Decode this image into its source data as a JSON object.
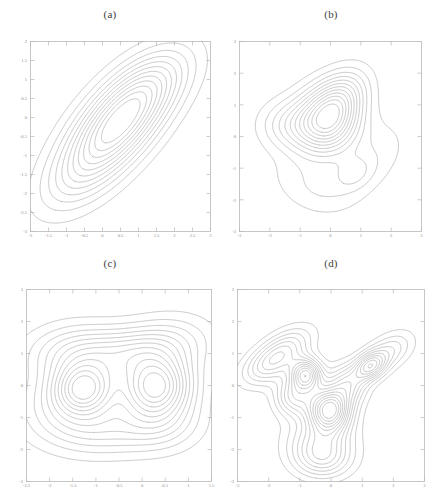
{
  "figure": {
    "background_color": "#ffffff",
    "contour_color": "#a5a5a5",
    "axis_color": "#b9b9b9",
    "label_color": "#8d8d8d"
  },
  "panels": [
    {
      "key": "a",
      "title": "(a)",
      "xlabels": [
        "-2",
        "-1.5",
        "-1",
        "-0.5",
        "0",
        "0.5",
        "1",
        "1.5",
        "2",
        "2.5",
        "3"
      ],
      "ylabels": [
        "2",
        "1.5",
        "1",
        "0.5",
        "0",
        "-0.5",
        "-1",
        "-1.5",
        "-2",
        "-2.5",
        "-3"
      ],
      "xlim": [
        -2,
        3
      ],
      "ylim": [
        -3,
        2
      ],
      "n_contours": 12,
      "modes": 1,
      "mode_centers": [
        [
          0.45,
          -0.2
        ]
      ]
    },
    {
      "key": "b",
      "title": "(b)",
      "xlabels": [
        "-3",
        "-2",
        "-1",
        "0",
        "1",
        "2",
        "3"
      ],
      "ylabels": [
        "3",
        "2",
        "1",
        "0",
        "-1",
        "-2",
        "-3"
      ],
      "xlim": [
        -3,
        3
      ],
      "ylim": [
        -3,
        3
      ],
      "n_contours": 12,
      "modes": 2,
      "mode_centers": [
        [
          -0.1,
          0.45
        ],
        [
          0.75,
          -1.15
        ]
      ]
    },
    {
      "key": "c",
      "title": "(c)",
      "xlabels": [
        "-2.5",
        "-2",
        "-1.5",
        "-1",
        "-0.5",
        "0",
        "0.5",
        "1",
        "1.5"
      ],
      "ylabels": [
        "3",
        "2",
        "1",
        "0",
        "-1",
        "-2",
        "-3"
      ],
      "xlim": [
        -2.5,
        1.5
      ],
      "ylim": [
        -3,
        3
      ],
      "n_contours": 12,
      "modes": 2,
      "mode_centers": [
        [
          -1.25,
          -0.1
        ],
        [
          0.3,
          -0.05
        ]
      ]
    },
    {
      "key": "d",
      "title": "(d)",
      "xlabels": [
        "-3",
        "-2",
        "-1",
        "0",
        "1",
        "2",
        "3"
      ],
      "ylabels": [
        "3",
        "2",
        "1",
        "0",
        "-1",
        "-2",
        "-3"
      ],
      "xlim": [
        -3,
        3
      ],
      "ylim": [
        -3,
        3
      ],
      "n_contours": 13,
      "modes": 3,
      "mode_centers": [
        [
          -0.8,
          0.35
        ],
        [
          1.25,
          0.6
        ],
        [
          -0.05,
          -0.75
        ]
      ]
    }
  ],
  "chart_data": {
    "type": "line",
    "subtype": "contour",
    "title": "",
    "panel_count": 4,
    "panels": [
      {
        "label": "(a)",
        "xlabel": "",
        "ylabel": "",
        "xlim": [
          -2,
          3
        ],
        "ylim": [
          -3,
          2
        ],
        "xticks": [
          -2,
          -1.5,
          -1,
          -0.5,
          0,
          0.5,
          1,
          1.5,
          2,
          2.5,
          3
        ],
        "yticks": [
          2,
          1.5,
          1,
          0.5,
          0,
          -0.5,
          -1,
          -1.5,
          -2,
          -2.5,
          -3
        ],
        "grid": false,
        "legend": "none",
        "levels": 12,
        "peaks": [
          {
            "x": 0.45,
            "y": -0.2,
            "relative_height": 1.0
          }
        ]
      },
      {
        "label": "(b)",
        "xlabel": "",
        "ylabel": "",
        "xlim": [
          -3,
          3
        ],
        "ylim": [
          -3,
          3
        ],
        "xticks": [
          -3,
          -2,
          -1,
          0,
          1,
          2,
          3
        ],
        "yticks": [
          3,
          2,
          1,
          0,
          -1,
          -2,
          -3
        ],
        "grid": false,
        "legend": "none",
        "levels": 12,
        "peaks": [
          {
            "x": -0.1,
            "y": 0.45,
            "relative_height": 1.0
          },
          {
            "x": 0.75,
            "y": -1.15,
            "relative_height": 0.28
          }
        ]
      },
      {
        "label": "(c)",
        "xlabel": "",
        "ylabel": "",
        "xlim": [
          -2.5,
          1.5
        ],
        "ylim": [
          -3,
          3
        ],
        "xticks": [
          -2.5,
          -2,
          -1.5,
          -1,
          -0.5,
          0,
          0.5,
          1,
          1.5
        ],
        "yticks": [
          3,
          2,
          1,
          0,
          -1,
          -2,
          -3
        ],
        "grid": false,
        "legend": "none",
        "levels": 12,
        "peaks": [
          {
            "x": -1.25,
            "y": -0.1,
            "relative_height": 0.9
          },
          {
            "x": 0.3,
            "y": -0.05,
            "relative_height": 1.0
          }
        ]
      },
      {
        "label": "(d)",
        "xlabel": "",
        "ylabel": "",
        "xlim": [
          -3,
          3
        ],
        "ylim": [
          -3,
          3
        ],
        "xticks": [
          -3,
          -2,
          -1,
          0,
          1,
          2,
          3
        ],
        "yticks": [
          3,
          2,
          1,
          0,
          -1,
          -2,
          -3
        ],
        "grid": false,
        "legend": "none",
        "levels": 13,
        "peaks": [
          {
            "x": -0.8,
            "y": 0.35,
            "relative_height": 0.85
          },
          {
            "x": 1.25,
            "y": 0.6,
            "relative_height": 0.6
          },
          {
            "x": -0.05,
            "y": -0.75,
            "relative_height": 1.0
          }
        ]
      }
    ]
  }
}
